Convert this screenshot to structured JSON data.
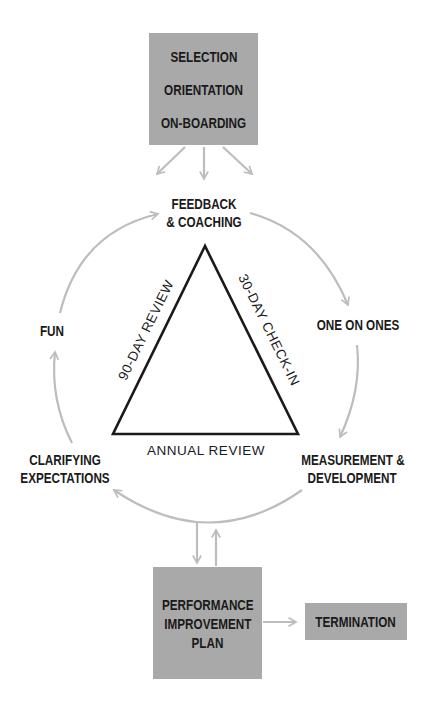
{
  "diagram": {
    "top_box": {
      "lines": [
        "SELECTION",
        "ORIENTATION",
        "ON-BOARDING"
      ]
    },
    "cycle_nodes": {
      "feedback": [
        "FEEDBACK",
        "& COACHING"
      ],
      "one_on_ones": [
        "ONE ON ONES"
      ],
      "measurement": [
        "MEASUREMENT &",
        "DEVELOPMENT"
      ],
      "clarifying": [
        "CLARIFYING",
        "EXPECTATIONS"
      ],
      "fun": [
        "FUN"
      ]
    },
    "triangle": {
      "left_side": "90-DAY REVIEW",
      "right_side": "30-DAY CHECK-IN",
      "base": "ANNUAL REVIEW"
    },
    "pip_box": {
      "lines": [
        "PERFORMANCE",
        "IMPROVEMENT",
        "PLAN"
      ]
    },
    "termination_box": {
      "label": "TERMINATION"
    },
    "colors": {
      "box_fill": "#a9a9a9",
      "arrow": "#bdbdbd",
      "triangle": "#1a1a1a",
      "text": "#1e1e1e"
    }
  }
}
